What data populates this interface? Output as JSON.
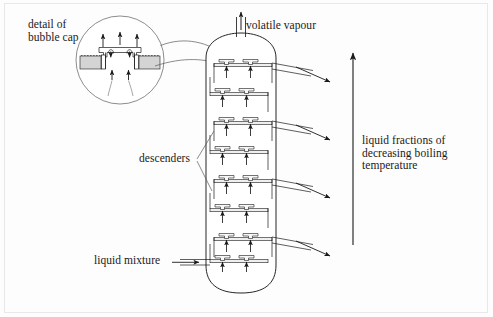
{
  "figure": {
    "background_color": "#fdfdfd",
    "border_color": "#e8e8e8",
    "line_color": "#1a1a1a",
    "liquid_fill_color": "#d4d4d4",
    "tray_fill_color": "#efefef"
  },
  "labels": {
    "detail_of_bubble_cap": "detail of\nbubble cap",
    "volatile_vapour": "volatile vapour",
    "descenders": "descenders",
    "liquid_fractions": "liquid fractions of\ndecreasing boiling\ntemperature",
    "liquid_mixture": "liquid mixture"
  },
  "column": {
    "tray_count": 8,
    "bubble_caps_per_tray": 2,
    "outlet_pipe_count": 4,
    "inlet_count": 1,
    "top_outlet": "volatile vapour pipe",
    "base_shape": "hemispherical"
  },
  "detail_callout": {
    "shape": "circle",
    "contents": "bubble cap with vapour arrows and liquid seal"
  },
  "direction_arrow": {
    "orientation": "up",
    "meaning": "decreasing boiling temperature"
  }
}
